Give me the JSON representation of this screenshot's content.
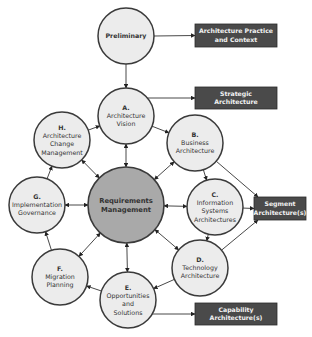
{
  "diagram": {
    "nodes": [
      {
        "id": "preliminary",
        "letter": "",
        "lines": [
          "Preliminary"
        ],
        "bold": true
      },
      {
        "id": "a",
        "letter": "A.",
        "lines": [
          "Architecture",
          "Vision"
        ]
      },
      {
        "id": "b",
        "letter": "B.",
        "lines": [
          "Business",
          "Architecture"
        ]
      },
      {
        "id": "c",
        "letter": "C.",
        "lines": [
          "Information",
          "Systems",
          "Architectures"
        ]
      },
      {
        "id": "d",
        "letter": "D.",
        "lines": [
          "Technology",
          "Architecture"
        ]
      },
      {
        "id": "e",
        "letter": "E.",
        "lines": [
          "Opportunities",
          "and",
          "Solutions"
        ]
      },
      {
        "id": "f",
        "letter": "F.",
        "lines": [
          "Migration",
          "Planning"
        ]
      },
      {
        "id": "g",
        "letter": "G.",
        "lines": [
          "Implementation",
          "Governance"
        ]
      },
      {
        "id": "h",
        "letter": "H.",
        "lines": [
          "Architecture",
          "Change",
          "Management"
        ]
      },
      {
        "id": "req",
        "letter": "",
        "lines": [
          "Requirements",
          "Management"
        ],
        "bold": true,
        "center": true
      }
    ],
    "outputs": [
      {
        "id": "practice",
        "lines": [
          "Architecture Practice",
          "and Context"
        ]
      },
      {
        "id": "strategic",
        "lines": [
          "Strategic",
          "Architecture"
        ]
      },
      {
        "id": "segment",
        "lines": [
          "Segment",
          "Architecture(s)"
        ]
      },
      {
        "id": "capability",
        "lines": [
          "Capability",
          "Architecture(s)"
        ]
      }
    ],
    "edges": [
      {
        "from": "preliminary",
        "to": "a",
        "type": "single"
      },
      {
        "from": "a",
        "to": "b",
        "type": "single"
      },
      {
        "from": "b",
        "to": "c",
        "type": "single"
      },
      {
        "from": "c",
        "to": "d",
        "type": "single"
      },
      {
        "from": "d",
        "to": "e",
        "type": "single"
      },
      {
        "from": "e",
        "to": "f",
        "type": "single"
      },
      {
        "from": "f",
        "to": "g",
        "type": "single"
      },
      {
        "from": "g",
        "to": "h",
        "type": "single"
      },
      {
        "from": "h",
        "to": "a",
        "type": "single"
      },
      {
        "from": "req",
        "to": "a",
        "type": "double"
      },
      {
        "from": "req",
        "to": "b",
        "type": "double"
      },
      {
        "from": "req",
        "to": "c",
        "type": "double"
      },
      {
        "from": "req",
        "to": "d",
        "type": "double"
      },
      {
        "from": "req",
        "to": "e",
        "type": "double"
      },
      {
        "from": "req",
        "to": "f",
        "type": "double"
      },
      {
        "from": "req",
        "to": "g",
        "type": "double"
      },
      {
        "from": "req",
        "to": "h",
        "type": "double"
      },
      {
        "from": "preliminary",
        "to": "practice",
        "type": "output"
      },
      {
        "from": "a",
        "to": "strategic",
        "type": "output"
      },
      {
        "from": "b",
        "to": "segment",
        "type": "output"
      },
      {
        "from": "c",
        "to": "segment",
        "type": "output"
      },
      {
        "from": "d",
        "to": "segment",
        "type": "output"
      },
      {
        "from": "e",
        "to": "capability",
        "type": "output"
      }
    ]
  }
}
